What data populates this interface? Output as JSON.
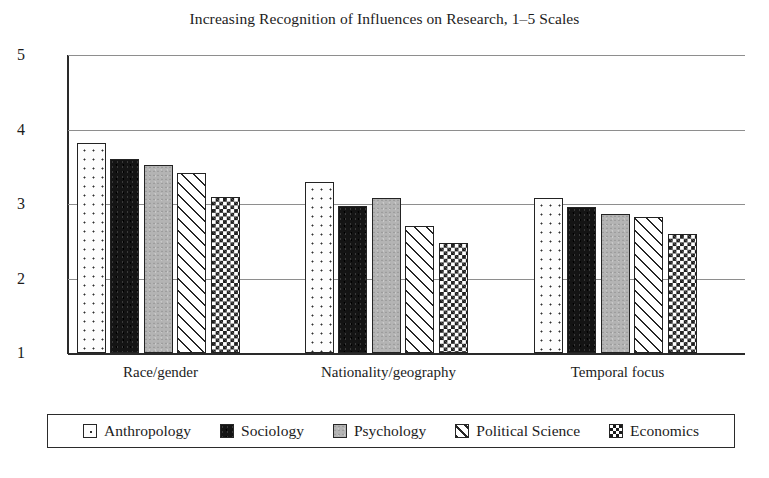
{
  "chart_data": {
    "type": "bar",
    "title": "Increasing Recognition of Influences on Research, 1–5 Scales",
    "xlabel": "",
    "ylabel": "",
    "ylim": [
      1,
      5
    ],
    "yticks": [
      1,
      2,
      3,
      4,
      5
    ],
    "ytick_labels": [
      "1",
      "2",
      "3",
      "4",
      "5"
    ],
    "grid": true,
    "legend_position": "bottom",
    "categories": [
      "Race/gender",
      "Nationality/geography",
      "Temporal focus"
    ],
    "series": [
      {
        "name": "Anthropology",
        "pattern": "dotted",
        "values": [
          3.82,
          3.3,
          3.08
        ]
      },
      {
        "name": "Sociology",
        "pattern": "solid",
        "values": [
          3.61,
          2.97,
          2.96
        ]
      },
      {
        "name": "Psychology",
        "pattern": "gray",
        "values": [
          3.53,
          3.08,
          2.87
        ]
      },
      {
        "name": "Political Science",
        "pattern": "hatch",
        "values": [
          3.41,
          2.7,
          2.83
        ]
      },
      {
        "name": "Economics",
        "pattern": "check",
        "values": [
          3.1,
          2.48,
          2.6
        ]
      }
    ]
  },
  "caption": ""
}
